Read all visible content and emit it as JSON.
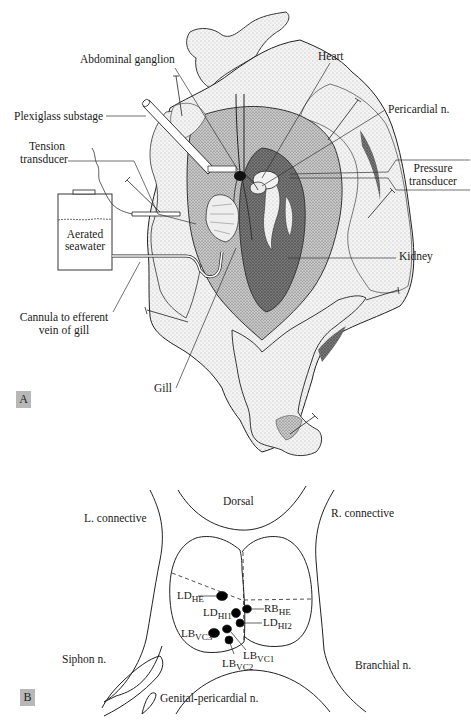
{
  "figure": {
    "panel_a": {
      "letter": "A",
      "labels": {
        "abdominal_ganglion": "Abdominal ganglion",
        "heart": "Heart",
        "plexiglass_substage": "Plexiglass substage",
        "pericardial_n": "Pericardial n.",
        "tension_transducer_1": "Tension",
        "tension_transducer_2": "transducer",
        "pressure_transducer_1": "Pressure",
        "pressure_transducer_2": "transducer",
        "aerated_seawater_1": "Aerated",
        "aerated_seawater_2": "seawater",
        "kidney": "Kidney",
        "cannula_1": "Cannula to efferent",
        "cannula_2": "vein of gill",
        "gill": "Gill"
      }
    },
    "panel_b": {
      "letter": "B",
      "labels": {
        "dorsal": "Dorsal",
        "l_connective": "L. connective",
        "r_connective": "R. connective",
        "siphon_n": "Siphon n.",
        "branchial_n": "Branchial n.",
        "genital_pericardial_n": "Genital-pericardial n."
      },
      "neurons": [
        {
          "base": "LD",
          "sub": "HE"
        },
        {
          "base": "LD",
          "sub": "HI1"
        },
        {
          "base": "RB",
          "sub": "HE"
        },
        {
          "base": "LD",
          "sub": "HI2"
        },
        {
          "base": "LB",
          "sub": "VC3"
        },
        {
          "base": "LB",
          "sub": "VC1"
        },
        {
          "base": "LB",
          "sub": "VC2"
        }
      ]
    }
  }
}
